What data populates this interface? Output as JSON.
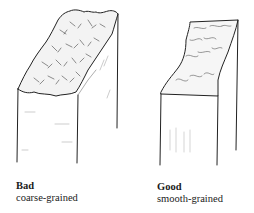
{
  "figures": [
    {
      "title": "Bad",
      "subtitle": "coarse-grained"
    },
    {
      "title": "Good",
      "subtitle": "smooth-grained"
    }
  ]
}
